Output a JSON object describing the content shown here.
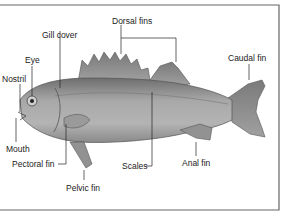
{
  "diagram": {
    "type": "labeled-anatomy",
    "colors": {
      "body": "#9a9a9a",
      "fin": "#8a8a8a",
      "line": "#222222",
      "frame": "#555555",
      "background": "#ffffff"
    },
    "labels": {
      "dorsal_fins": "Dorsal fins",
      "gill_cover": "Gill cover",
      "eye": "Eye",
      "nostril": "Nostril",
      "caudal_fin": "Caudal fin",
      "mouth": "Mouth",
      "pectoral_fin": "Pectoral fin",
      "pelvic_fin": "Pelvic fin",
      "scales": "Scales",
      "anal_fin": "Anal fin"
    }
  }
}
